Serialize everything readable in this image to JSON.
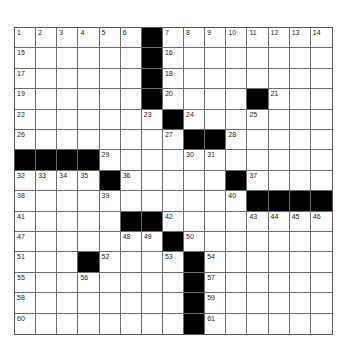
{
  "puzzle": {
    "rows": 15,
    "cols": 15,
    "layout": [
      "......#........",
      "......#........",
      "......#........",
      "......#....#...",
      ".......#.......",
      "........##.....",
      "####...........",
      "....#.....#....",
      "...........####",
      ".....##........",
      ".......#.......",
      "...#....#......",
      "........#......",
      "........#......",
      "........#......"
    ],
    "numbers": [
      [
        1,
        2,
        3,
        4,
        5,
        6,
        0,
        7,
        8,
        9,
        10,
        11,
        12,
        13,
        14
      ],
      [
        15,
        0,
        0,
        0,
        0,
        0,
        0,
        16,
        0,
        0,
        0,
        0,
        0,
        0,
        0
      ],
      [
        17,
        0,
        0,
        0,
        0,
        0,
        0,
        18,
        0,
        0,
        0,
        0,
        0,
        0,
        0
      ],
      [
        19,
        0,
        0,
        0,
        0,
        0,
        0,
        20,
        0,
        0,
        0,
        0,
        21,
        0,
        0
      ],
      [
        22,
        0,
        0,
        0,
        0,
        0,
        23,
        0,
        24,
        0,
        0,
        25,
        0,
        0,
        0
      ],
      [
        26,
        0,
        0,
        0,
        0,
        0,
        0,
        27,
        0,
        0,
        28,
        0,
        0,
        0,
        0
      ],
      [
        0,
        0,
        0,
        0,
        29,
        0,
        0,
        0,
        30,
        31,
        0,
        0,
        0,
        0,
        0
      ],
      [
        32,
        33,
        34,
        35,
        0,
        36,
        0,
        0,
        0,
        0,
        0,
        37,
        0,
        0,
        0
      ],
      [
        38,
        0,
        0,
        0,
        39,
        0,
        0,
        0,
        0,
        0,
        40,
        0,
        0,
        0,
        0
      ],
      [
        41,
        0,
        0,
        0,
        0,
        0,
        0,
        42,
        0,
        0,
        0,
        43,
        44,
        45,
        46
      ],
      [
        47,
        0,
        0,
        0,
        0,
        48,
        49,
        0,
        50,
        0,
        0,
        0,
        0,
        0,
        0
      ],
      [
        51,
        0,
        0,
        0,
        52,
        0,
        0,
        53,
        0,
        54,
        0,
        0,
        0,
        0,
        0
      ],
      [
        55,
        0,
        0,
        56,
        0,
        0,
        0,
        0,
        0,
        57,
        0,
        0,
        0,
        0,
        0
      ],
      [
        58,
        0,
        0,
        0,
        0,
        0,
        0,
        0,
        0,
        59,
        0,
        0,
        0,
        0,
        0
      ],
      [
        60,
        0,
        0,
        0,
        0,
        0,
        0,
        0,
        0,
        61,
        0,
        0,
        0,
        0,
        0
      ]
    ]
  },
  "colors": {
    "black_square": "#000000",
    "white_square": "#ffffff",
    "grid_line": "#6a6a6a"
  }
}
